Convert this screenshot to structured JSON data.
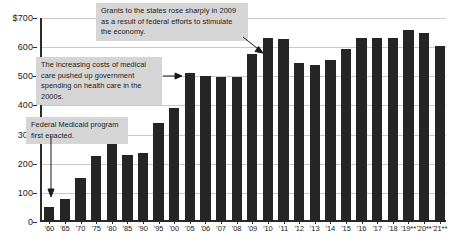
{
  "chart_data": {
    "type": "bar",
    "title": "",
    "subtitle": "",
    "xlabel": "",
    "ylabel": "",
    "ylim": [
      0,
      700
    ],
    "y_ticks": [
      0,
      100,
      200,
      300,
      400,
      500,
      600,
      700
    ],
    "y_tick_labels": [
      "0",
      "100",
      "200",
      "300",
      "400",
      "500",
      "600",
      "$700"
    ],
    "grid": true,
    "legend": "none",
    "categories": [
      "'60",
      "'65",
      "'70",
      "'75",
      "'80",
      "'85",
      "'90",
      "'95",
      "'00",
      "'05",
      "'06",
      "'07",
      "'08",
      "'09",
      "'10",
      "'11",
      "'12",
      "'13",
      "'14",
      "'15",
      "'16",
      "'17",
      "'18",
      "'19**",
      "'20**",
      "'21**"
    ],
    "values": [
      52,
      78,
      150,
      228,
      283,
      231,
      238,
      340,
      390,
      512,
      500,
      497,
      497,
      577,
      633,
      628,
      545,
      538,
      557,
      595,
      632,
      633,
      633,
      660,
      648,
      605
    ],
    "series": [
      {
        "name": "Federal grants to state and local governments (billions of dollars)",
        "values": [
          52,
          78,
          150,
          228,
          283,
          231,
          238,
          340,
          390,
          512,
          500,
          497,
          497,
          577,
          633,
          628,
          545,
          538,
          557,
          595,
          632,
          633,
          633,
          660,
          648,
          605
        ]
      }
    ],
    "annotations": [
      {
        "id": "grants",
        "text": "Grants to the states rose sharply in 2009 as a result of federal efforts to stimulate the economy.",
        "points_to": "'09"
      },
      {
        "id": "medical",
        "text": "The increasing costs of medical care pushed up government spending on health care in the 2000s.",
        "points_to": "'05"
      },
      {
        "id": "medicaid",
        "text": "Federal Medicaid program first enacted.",
        "points_to": "'65"
      }
    ],
    "colors": {
      "bar": "#252525",
      "gridline": "#c9c9c9",
      "axis": "#2b2b2b",
      "annotation_background": "#d5d5d5",
      "background": "#ffffff"
    }
  }
}
